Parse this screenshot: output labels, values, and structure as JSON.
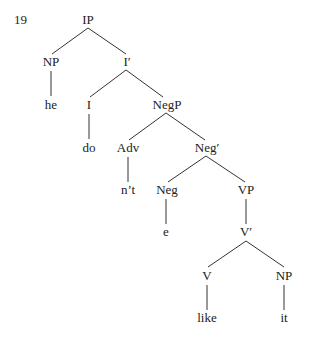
{
  "example_number": "19",
  "nodes": {
    "ip": "IP",
    "np_subj": "NP",
    "he": "he",
    "i_bar": "I′",
    "i": "I",
    "do": "do",
    "negp": "NegP",
    "adv": "Adv",
    "nt": "n’t",
    "neg_bar": "Neg′",
    "neg": "Neg",
    "e": "e",
    "vp": "VP",
    "v_bar": "V′",
    "v": "V",
    "like": "like",
    "np_obj": "NP",
    "it": "it"
  }
}
